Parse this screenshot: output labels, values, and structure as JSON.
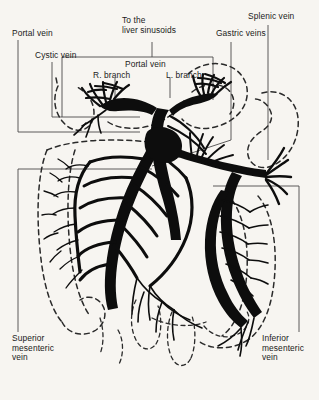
{
  "figure": {
    "background_color": "#f7f5f1",
    "vessel_color": "#0d0d0d",
    "outline_color": "#2a2a2a",
    "text_color": "#1a1a1a"
  },
  "labels": {
    "portal_vein": "Portal vein",
    "cystic_vein": "Cystic vein",
    "to_the_liver_sinusoids": "To the\nliver sinusoids",
    "portal_vein_center": "Portal vein",
    "r_branch": "R. branch",
    "l_branch": "L. branch",
    "gastric_veins": "Gastric veins",
    "splenic_vein": "Splenic vein",
    "superior_mesenteric_vein": "Superior\nmesenteric\nvein",
    "inferior_mesenteric_vein": "Inferior\nmesenteric\nvein"
  },
  "label_lines": {
    "portal_vein_line1": "Portal vein",
    "cystic_vein_line1": "Cystic vein",
    "sinusoids_line1": "To the",
    "sinusoids_line2": "liver sinusoids",
    "smv_line1": "Superior",
    "smv_line2": "mesenteric",
    "smv_line3": "vein",
    "imv_line1": "Inferior",
    "imv_line2": "mesenteric",
    "imv_line3": "vein"
  },
  "structures": [
    {
      "name": "portal-vein-trunk",
      "kind": "vein"
    },
    {
      "name": "portal-vein-right-branch",
      "kind": "vein"
    },
    {
      "name": "portal-vein-left-branch",
      "kind": "vein"
    },
    {
      "name": "cystic-vein",
      "kind": "vein"
    },
    {
      "name": "gastric-veins",
      "kind": "vein"
    },
    {
      "name": "splenic-vein",
      "kind": "vein"
    },
    {
      "name": "superior-mesenteric-vein",
      "kind": "vein"
    },
    {
      "name": "inferior-mesenteric-vein",
      "kind": "vein"
    },
    {
      "name": "gallbladder-outline",
      "kind": "organ-outline"
    },
    {
      "name": "stomach-outline",
      "kind": "organ-outline"
    },
    {
      "name": "spleen-outline",
      "kind": "organ-outline"
    },
    {
      "name": "ascending-colon-outline",
      "kind": "organ-outline"
    },
    {
      "name": "descending-colon-outline",
      "kind": "organ-outline"
    },
    {
      "name": "small-intestine-outline",
      "kind": "organ-outline"
    }
  ]
}
